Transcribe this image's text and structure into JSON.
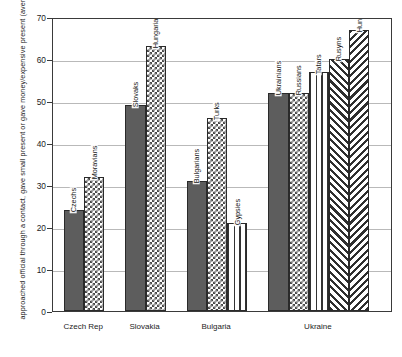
{
  "chart_data": {
    "type": "bar",
    "title": "",
    "subtitle": "",
    "xlabel": "",
    "ylabel": "approached official through a contact, gave small present or gave money/expensive present (average %)",
    "ylim": [
      0,
      70
    ],
    "yticks": [
      0,
      10,
      20,
      30,
      40,
      50,
      60,
      70
    ],
    "grid": true,
    "legend": "none (bars labelled in place)",
    "categories": [
      "Czech Rep",
      "Slovakia",
      "Bulgaria",
      "Ukraine"
    ],
    "groups": [
      {
        "category": "Czech Rep",
        "bars": [
          {
            "label": "Czechs",
            "value": 24,
            "pattern": "solid"
          },
          {
            "label": "Moravians",
            "value": 32,
            "pattern": "checker"
          }
        ]
      },
      {
        "category": "Slovakia",
        "bars": [
          {
            "label": "Slovaks",
            "value": 49,
            "pattern": "solid"
          },
          {
            "label": "Hungarians",
            "value": 63,
            "pattern": "checker"
          }
        ]
      },
      {
        "category": "Bulgaria",
        "bars": [
          {
            "label": "Bulgarians",
            "value": 31,
            "pattern": "solid"
          },
          {
            "label": "Turks",
            "value": 46,
            "pattern": "checker"
          },
          {
            "label": "Gypsies",
            "value": 21,
            "pattern": "vertical-lines"
          }
        ]
      },
      {
        "category": "Ukraine",
        "bars": [
          {
            "label": "Ukrainians",
            "value": 52,
            "pattern": "solid"
          },
          {
            "label": "Russians",
            "value": 52,
            "pattern": "checker"
          },
          {
            "label": "Tatars",
            "value": 57,
            "pattern": "vertical-lines"
          },
          {
            "label": "Rusyns",
            "value": 60,
            "pattern": "diagonal-right"
          },
          {
            "label": "Hungarians",
            "value": 67,
            "pattern": "diagonal-left"
          }
        ]
      }
    ],
    "colors": {
      "solid_fill": "#5d5d5d",
      "pattern_ink": "#333333",
      "pattern_ground": "#ffffff",
      "axis": "#3a3a3a",
      "gridline": "#b9b9b9"
    }
  }
}
